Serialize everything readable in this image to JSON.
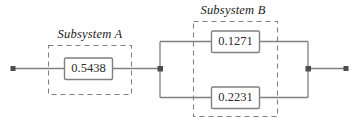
{
  "diagram": {
    "type": "reliability-block-diagram",
    "title": "",
    "background_color": "#ffffff",
    "line_color": "#808080",
    "node_color": "#4d4d4d",
    "text_color": "#2b2b2b",
    "subsystems": [
      {
        "id": "subsystem-a",
        "label": "Subsystem A",
        "arrangement": "series",
        "blocks": [
          {
            "id": "block-a1",
            "value": "0.5438"
          }
        ]
      },
      {
        "id": "subsystem-b",
        "label": "Subsystem B",
        "arrangement": "parallel",
        "blocks": [
          {
            "id": "block-b1",
            "value": "0.1271"
          },
          {
            "id": "block-b2",
            "value": "0.2231"
          }
        ]
      }
    ],
    "terminals": [
      {
        "id": "terminal-left",
        "position": "left"
      },
      {
        "id": "terminal-right",
        "position": "right"
      }
    ],
    "junctions": [
      {
        "id": "junction-split",
        "position": "mid-left"
      },
      {
        "id": "junction-merge",
        "position": "mid-right"
      }
    ]
  }
}
